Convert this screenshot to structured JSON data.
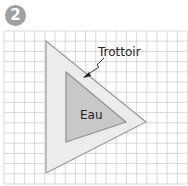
{
  "badge": {
    "number": "2"
  },
  "labels": {
    "sidewalk": "Trottoir",
    "water": "Eau"
  },
  "colors": {
    "badge": "#a0a0a0",
    "grid": "#cfcfcf",
    "outer_fill": "#ececec",
    "outer_stroke": "#9a9a9a",
    "inner_fill": "#c9c9c9",
    "inner_stroke": "#8e8e8e"
  },
  "grid": {
    "x0": 4,
    "y0": 31,
    "cell": 10.2,
    "cols": 18,
    "rows": 15
  },
  "shapes": {
    "outer_triangle": [
      [
        46,
        41
      ],
      [
        146,
        122
      ],
      [
        46,
        173
      ]
    ],
    "inner_triangle": [
      [
        66,
        72
      ],
      [
        126,
        122
      ],
      [
        66,
        142
      ]
    ]
  }
}
